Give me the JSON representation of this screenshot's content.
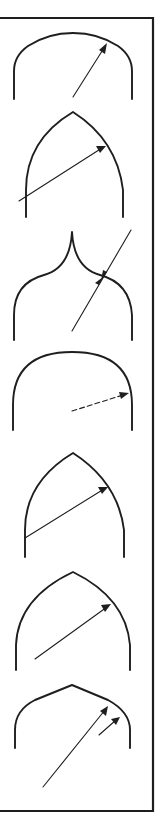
{
  "figure": {
    "stroke_color": "#1e1e1e",
    "background": "#ffffff",
    "frame": {
      "top": 18,
      "right": 153,
      "bottom": 811
    },
    "arches": [
      {
        "id": 1,
        "type": "segmental-round-arch",
        "apex_y": 33,
        "legs_x": [
          14,
          132
        ],
        "bottom_y": 99,
        "arrows": [
          {
            "from": [
              73,
              97
            ],
            "to": [
              107,
              43
            ],
            "style": "solid"
          }
        ]
      },
      {
        "id": 2,
        "type": "pointed-arch",
        "apex": [
          73,
          112
        ],
        "legs_x": [
          26,
          123
        ],
        "bottom_y": 217,
        "arrows": [
          {
            "from": [
              19,
              201
            ],
            "to": [
              106,
              146
            ],
            "style": "solid"
          }
        ]
      },
      {
        "id": 3,
        "type": "ogee-arch",
        "apex": [
          72,
          232
        ],
        "legs_x": [
          14,
          132
        ],
        "bottom_y": 340,
        "arrows": [
          {
            "from": [
              72,
              331
            ],
            "to": [
              131,
              230
            ],
            "style": "solid",
            "double_inward_heads_at": [
              102,
              279
            ]
          }
        ]
      },
      {
        "id": 4,
        "type": "semicircular-arch",
        "apex_y": 352,
        "legs_x": [
          13,
          132
        ],
        "bottom_y": 430,
        "arrows": [
          {
            "from": [
              72,
              411
            ],
            "to": [
              129,
              393
            ],
            "style": "dashed"
          }
        ]
      },
      {
        "id": 5,
        "type": "equilateral-pointed-arch",
        "apex": [
          73,
          453
        ],
        "legs_x": [
          25,
          124
        ],
        "bottom_y": 557,
        "arrows": [
          {
            "from": [
              25,
              538
            ],
            "to": [
              108,
              487
            ],
            "style": "solid"
          }
        ]
      },
      {
        "id": 6,
        "type": "drop-pointed-arch",
        "apex": [
          73,
          572
        ],
        "legs_x": [
          16,
          130
        ],
        "bottom_y": 670,
        "arrows": [
          {
            "from": [
              35,
              659
            ],
            "to": [
              111,
              604
            ],
            "style": "solid"
          }
        ]
      },
      {
        "id": 7,
        "type": "four-centred-arch",
        "apex": [
          72,
          685
        ],
        "legs_x": [
          15,
          130
        ],
        "bottom_y": 748,
        "arrows": [
          {
            "from": [
              43,
              787
            ],
            "to": [
              108,
              706
            ],
            "style": "solid"
          },
          {
            "from": [
              99,
              735
            ],
            "to": [
              120,
              717
            ],
            "style": "solid"
          }
        ]
      }
    ],
    "labels": {
      "arch_1": "Segmental arch",
      "arch_2": "Pointed arch",
      "arch_3": "Ogee arch",
      "arch_4": "Semicircular arch",
      "arch_5": "Equilateral arch",
      "arch_6": "Drop arch",
      "arch_7": "Four-centred arch"
    }
  }
}
